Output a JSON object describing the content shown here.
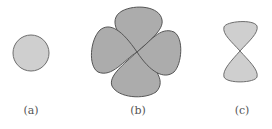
{
  "figure": {
    "panels": [
      {
        "id": "a",
        "label": "(a)",
        "shape": "circle",
        "fill": "#cfcfcf",
        "stroke": "#6e6e6e"
      },
      {
        "id": "b",
        "label": "(b)",
        "shape": "four-lobe cloverleaf",
        "fill": "#acacac",
        "stroke": "#555555"
      },
      {
        "id": "c",
        "label": "(c)",
        "shape": "two-lobe hourglass",
        "fill": "#cfcfcf",
        "stroke": "#6e6e6e"
      }
    ]
  }
}
